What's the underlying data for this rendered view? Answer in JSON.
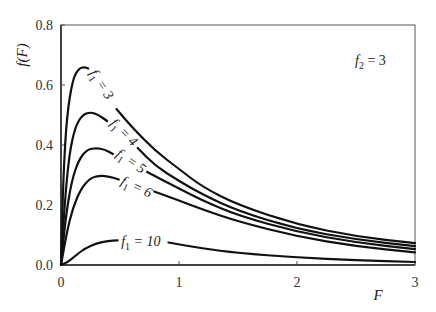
{
  "chart_data": {
    "type": "line",
    "title": "",
    "xlabel": "F",
    "ylabel": "f(F)",
    "xlim": [
      0,
      3
    ],
    "ylim": [
      0,
      0.8
    ],
    "x_ticks": [
      "0",
      "1",
      "2",
      "3"
    ],
    "y_ticks": [
      "0.0",
      "0.2",
      "0.4",
      "0.6",
      "0.8"
    ],
    "grid": false,
    "legend": "inline curve labels",
    "annotation": {
      "text_main": "f",
      "text_sub": "2",
      "text_rest": " = 3"
    },
    "series": [
      {
        "name": "f1 = 3",
        "label_sub": "1",
        "label_value": "3",
        "gap": [
          0.23,
          0.47
        ],
        "label_pos": {
          "x": 0.24,
          "y": 0.64,
          "angle": 58
        },
        "points": [
          [
            0,
            0
          ],
          [
            0.02,
            0.3
          ],
          [
            0.05,
            0.5
          ],
          [
            0.1,
            0.62
          ],
          [
            0.15,
            0.655
          ],
          [
            0.2,
            0.66
          ],
          [
            0.23,
            0.655
          ],
          [
            0.47,
            0.52
          ],
          [
            0.6,
            0.46
          ],
          [
            0.8,
            0.38
          ],
          [
            1.0,
            0.32
          ],
          [
            1.2,
            0.26
          ],
          [
            1.5,
            0.2
          ],
          [
            2.0,
            0.135
          ],
          [
            2.5,
            0.095
          ],
          [
            3.0,
            0.073
          ]
        ]
      },
      {
        "name": "f1 = 4",
        "label_sub": "1",
        "label_value": "4",
        "gap": [
          0.39,
          0.65
        ],
        "label_pos": {
          "x": 0.41,
          "y": 0.47,
          "angle": 45
        },
        "points": [
          [
            0,
            0
          ],
          [
            0.03,
            0.2
          ],
          [
            0.07,
            0.37
          ],
          [
            0.12,
            0.46
          ],
          [
            0.18,
            0.5
          ],
          [
            0.25,
            0.51
          ],
          [
            0.32,
            0.5
          ],
          [
            0.39,
            0.48
          ],
          [
            0.65,
            0.39
          ],
          [
            0.8,
            0.33
          ],
          [
            1.0,
            0.28
          ],
          [
            1.2,
            0.235
          ],
          [
            1.5,
            0.18
          ],
          [
            2.0,
            0.12
          ],
          [
            2.5,
            0.085
          ],
          [
            3.0,
            0.063
          ]
        ]
      },
      {
        "name": "f1 = 5",
        "label_sub": "1",
        "label_value": "5",
        "gap": [
          0.44,
          0.73
        ],
        "label_pos": {
          "x": 0.46,
          "y": 0.365,
          "angle": 35
        },
        "points": [
          [
            0,
            0
          ],
          [
            0.04,
            0.16
          ],
          [
            0.09,
            0.28
          ],
          [
            0.15,
            0.35
          ],
          [
            0.22,
            0.385
          ],
          [
            0.3,
            0.39
          ],
          [
            0.37,
            0.385
          ],
          [
            0.44,
            0.37
          ],
          [
            0.73,
            0.31
          ],
          [
            0.9,
            0.275
          ],
          [
            1.0,
            0.255
          ],
          [
            1.2,
            0.215
          ],
          [
            1.5,
            0.165
          ],
          [
            2.0,
            0.11
          ],
          [
            2.5,
            0.075
          ],
          [
            3.0,
            0.053
          ]
        ]
      },
      {
        "name": "f1 = 6",
        "label_sub": "1",
        "label_value": "6",
        "gap": [
          0.49,
          0.79
        ],
        "label_pos": {
          "x": 0.5,
          "y": 0.27,
          "angle": 25
        },
        "points": [
          [
            0,
            0
          ],
          [
            0.05,
            0.11
          ],
          [
            0.1,
            0.19
          ],
          [
            0.17,
            0.255
          ],
          [
            0.25,
            0.29
          ],
          [
            0.33,
            0.298
          ],
          [
            0.41,
            0.295
          ],
          [
            0.49,
            0.285
          ],
          [
            0.79,
            0.245
          ],
          [
            1.0,
            0.215
          ],
          [
            1.2,
            0.185
          ],
          [
            1.5,
            0.145
          ],
          [
            2.0,
            0.095
          ],
          [
            2.5,
            0.062
          ],
          [
            3.0,
            0.042
          ]
        ]
      },
      {
        "name": "f1 = 10",
        "label_sub": "1",
        "label_value": "10",
        "gap": [
          0.48,
          0.91
        ],
        "label_pos": {
          "x": 0.51,
          "y": 0.062,
          "angle": 0
        },
        "points": [
          [
            0,
            0
          ],
          [
            0.05,
            0.008
          ],
          [
            0.12,
            0.03
          ],
          [
            0.2,
            0.055
          ],
          [
            0.3,
            0.072
          ],
          [
            0.4,
            0.08
          ],
          [
            0.48,
            0.082
          ],
          [
            0.91,
            0.075
          ],
          [
            1.2,
            0.055
          ],
          [
            1.5,
            0.04
          ],
          [
            2.0,
            0.025
          ],
          [
            2.5,
            0.016
          ],
          [
            3.0,
            0.01
          ]
        ]
      }
    ]
  }
}
